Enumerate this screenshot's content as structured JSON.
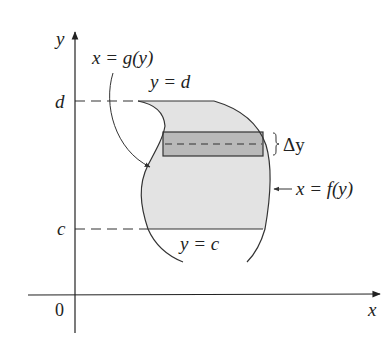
{
  "figure": {
    "axes": {
      "x_label": "x",
      "y_label": "y",
      "origin_label": "0"
    },
    "ticks": {
      "d_label": "d",
      "c_label": "c"
    },
    "curves": {
      "left_curve_label": "x = g(y)",
      "right_curve_label": "x = f(y)",
      "top_boundary_label": "y = d",
      "bottom_boundary_label": "y = c"
    },
    "strip": {
      "thickness_label": "Δy"
    },
    "colors": {
      "region_fill": "#e3e3e3",
      "strip_fill": "#b9b9b9",
      "stroke": "#333333"
    }
  }
}
